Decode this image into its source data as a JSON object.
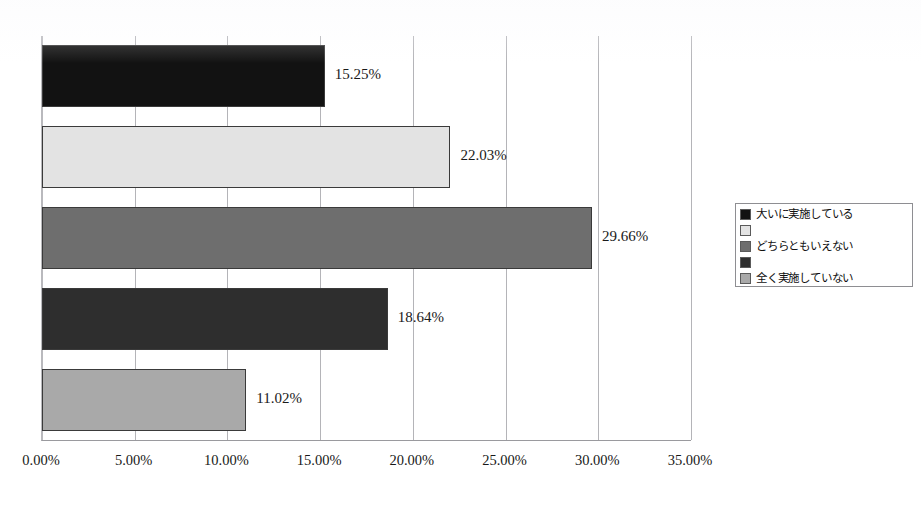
{
  "chart_data": {
    "type": "bar",
    "orientation": "horizontal",
    "title": "",
    "xlabel": "",
    "ylabel": "",
    "categories": [
      "大いに実施している",
      "",
      "どちらともいえない",
      "",
      "全く実施していない"
    ],
    "values": [
      15.25,
      22.03,
      29.66,
      18.64,
      11.02
    ],
    "data_labels": [
      "15.25%",
      "22.03%",
      "29.66%",
      "18.64%",
      "11.02%"
    ],
    "xlim": [
      0,
      35
    ],
    "xtick_labels": [
      "0.00%",
      "5.00%",
      "10.00%",
      "15.00%",
      "20.00%",
      "25.00%",
      "30.00%",
      "35.00%"
    ],
    "xtick_values": [
      0,
      5,
      10,
      15,
      20,
      25,
      30,
      35
    ],
    "grid": true,
    "grid_axis": "x",
    "legend_position": "right",
    "bar_colors": [
      "#121212",
      "#e3e3e3",
      "#6e6e6e",
      "#2e2e2e",
      "#a9a9a9"
    ],
    "bar_border_color": "#3a3a3a"
  },
  "legend": {
    "items": [
      {
        "label": "大いに実施している",
        "color": "#121212"
      },
      {
        "label": "",
        "color": "#e3e3e3"
      },
      {
        "label": "どちらともいえない",
        "color": "#6e6e6e"
      },
      {
        "label": "",
        "color": "#2e2e2e"
      },
      {
        "label": "全く実施していない",
        "color": "#a9a9a9"
      }
    ]
  },
  "title_strip": {
    "text": ""
  }
}
